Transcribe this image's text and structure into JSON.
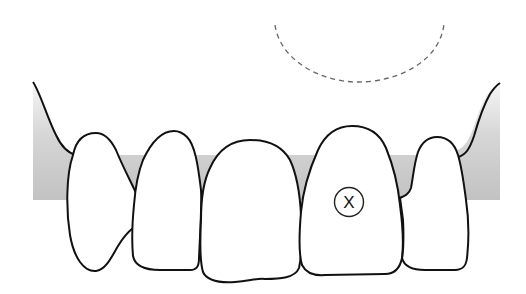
{
  "diagram": {
    "marker": {
      "label": "X",
      "tooth_index": 3
    },
    "colors": {
      "outline": "#111111",
      "gum_fill_top": "#f4f4f4",
      "gum_fill_bottom": "#c4c4c4",
      "tooth_fill": "#ffffff",
      "dashed_arc": "#666666",
      "background": "#ffffff"
    },
    "teeth": [
      {
        "name": "left-lateral-tooth"
      },
      {
        "name": "left-central-adjacent-tooth"
      },
      {
        "name": "central-tooth"
      },
      {
        "name": "marked-tooth"
      },
      {
        "name": "right-lateral-tooth"
      }
    ]
  }
}
